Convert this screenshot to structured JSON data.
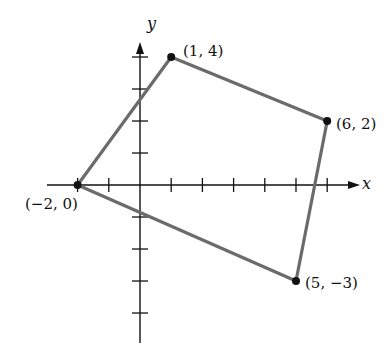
{
  "figure": {
    "type": "coordinate-plane-polygon",
    "x_axis_label": "x",
    "y_axis_label": "y",
    "unit_px_x": 31.2,
    "unit_px_y": 32,
    "origin_px": [
      140,
      185
    ],
    "x_ticks": [
      -2,
      -1,
      1,
      2,
      3,
      4,
      5,
      6
    ],
    "y_ticks": [
      -4,
      -3,
      -2,
      -1,
      1,
      2,
      3,
      4
    ],
    "polygon_color": "#6b6b6b",
    "axis_color": "#111111"
  },
  "points": [
    {
      "x": -2,
      "y": 0,
      "label": "(−2, 0)"
    },
    {
      "x": 1,
      "y": 4,
      "label": "(1, 4)"
    },
    {
      "x": 6,
      "y": 2,
      "label": "(6, 2)"
    },
    {
      "x": 5,
      "y": -3,
      "label": "(5, −3)"
    }
  ]
}
